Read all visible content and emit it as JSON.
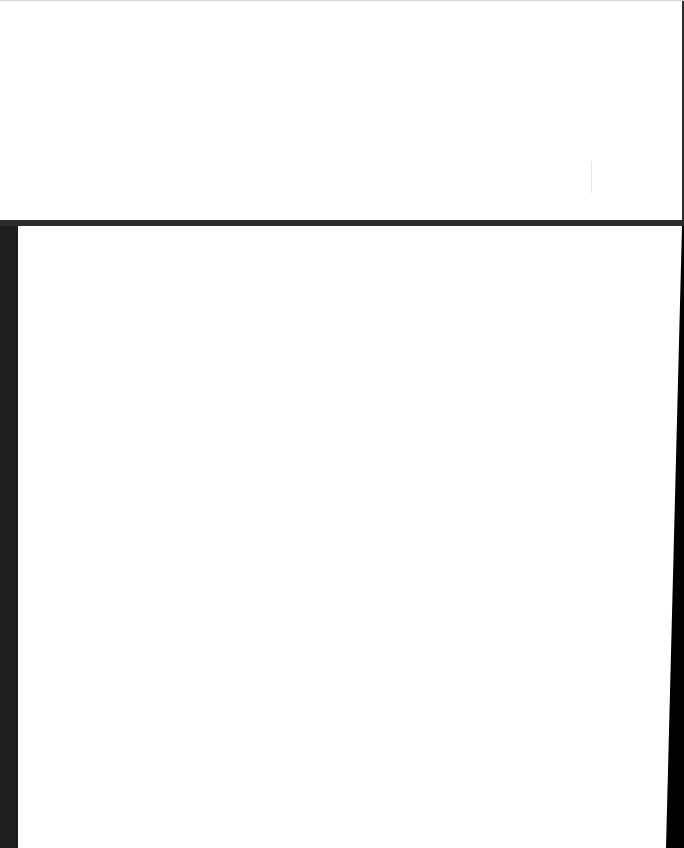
{
  "page": {
    "background": "#ffffff",
    "top_panel": {
      "background": "#ffffff",
      "text": ""
    },
    "divider": {
      "color": "#2b2b2b"
    },
    "bottom_panel": {
      "background": "#ffffff",
      "text": ""
    },
    "left_bar": {
      "color": "#1e1e1e"
    },
    "right_edge": {
      "color": "#000000"
    }
  }
}
